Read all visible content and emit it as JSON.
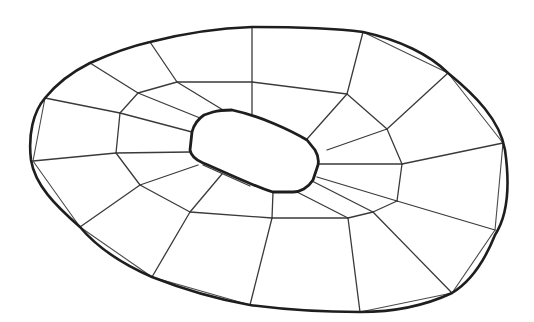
{
  "figure": {
    "width": 534,
    "height": 322,
    "colors": {
      "background": "#ffffff",
      "boundary_stroke": "#1e1e1e",
      "mesh_stroke": "#3a3a3a"
    }
  },
  "outer_boundary_path": "M 252 27 C 300 27, 340 29, 363 32 C 400 40, 430 55, 448 73 C 475 95, 500 120, 505 150 C 510 185, 508 215, 495 235 C 485 260, 470 282, 452 293 C 420 308, 390 312, 360 312 C 320 312, 280 309, 250 305 C 210 298, 180 288, 152 277 C 120 263, 95 245, 80 227 C 55 205, 35 185, 31 160 C 28 135, 33 112, 45 98 C 58 82, 72 72, 90 63 C 110 54, 128 47, 150 42 C 185 33, 220 28, 252 27 Z",
  "inner_boundary_path": "M 213 112 C 220 110, 226 110, 232 110 C 260 116, 290 130, 307 140 L 315 150 C 318 155, 319 160, 318 165 L 313 180 C 308 188, 300 192, 293 192 L 273 192 C 255 187, 225 172, 203 163 C 196 160, 191 156, 190 150 L 192 132 C 194 124, 198 119, 204 115 Z",
  "chord_segments": [
    [
      45,
      98,
      33,
      161
    ],
    [
      33,
      161,
      80,
      227
    ],
    [
      80,
      227,
      152,
      277
    ],
    [
      152,
      277,
      250,
      305
    ],
    [
      360,
      312,
      452,
      293
    ],
    [
      452,
      293,
      495,
      230
    ],
    [
      495,
      230,
      503,
      143
    ],
    [
      503,
      143,
      448,
      73
    ],
    [
      448,
      73,
      363,
      32
    ]
  ],
  "mesh_segments": [
    [
      90,
      63,
      138,
      93
    ],
    [
      150,
      42,
      177,
      82
    ],
    [
      252,
      27,
      252,
      116
    ],
    [
      363,
      32,
      347,
      94
    ],
    [
      448,
      73,
      387,
      129
    ],
    [
      503,
      143,
      402,
      164
    ],
    [
      495,
      230,
      397,
      201
    ],
    [
      452,
      293,
      373,
      212
    ],
    [
      360,
      312,
      348,
      218
    ],
    [
      250,
      305,
      272,
      218
    ],
    [
      152,
      277,
      190,
      212
    ],
    [
      80,
      227,
      140,
      185
    ],
    [
      33,
      161,
      116,
      153
    ],
    [
      45,
      98,
      120,
      113
    ],
    [
      138,
      93,
      177,
      82
    ],
    [
      177,
      82,
      252,
      82
    ],
    [
      252,
      82,
      347,
      94
    ],
    [
      347,
      94,
      387,
      129
    ],
    [
      387,
      129,
      402,
      164
    ],
    [
      402,
      164,
      397,
      201
    ],
    [
      397,
      201,
      373,
      212
    ],
    [
      373,
      212,
      348,
      218
    ],
    [
      348,
      218,
      272,
      218
    ],
    [
      272,
      218,
      190,
      212
    ],
    [
      190,
      212,
      140,
      185
    ],
    [
      140,
      185,
      116,
      153
    ],
    [
      116,
      153,
      120,
      113
    ],
    [
      120,
      113,
      138,
      93
    ],
    [
      177,
      82,
      223,
      110
    ],
    [
      138,
      93,
      200,
      118
    ],
    [
      120,
      113,
      192,
      132
    ],
    [
      116,
      153,
      190,
      152
    ],
    [
      140,
      185,
      198,
      165
    ],
    [
      190,
      212,
      222,
      174
    ],
    [
      272,
      218,
      273,
      192
    ],
    [
      348,
      218,
      297,
      192
    ],
    [
      373,
      212,
      312,
      181
    ],
    [
      397,
      201,
      317,
      177
    ],
    [
      402,
      164,
      318,
      164
    ],
    [
      387,
      129,
      327,
      150
    ],
    [
      347,
      94,
      307,
      139
    ],
    [
      203,
      165,
      250,
      186
    ]
  ]
}
